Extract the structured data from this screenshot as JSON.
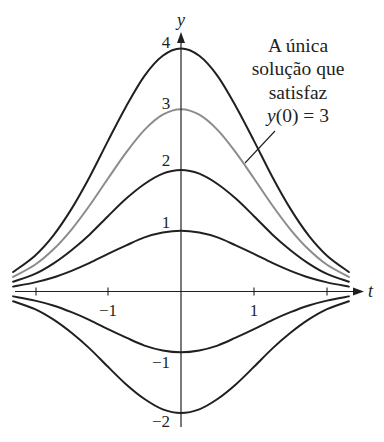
{
  "chart_data": {
    "type": "line",
    "title": "",
    "xlabel": "t",
    "ylabel": "y",
    "xlim": [
      -2.3,
      2.35
    ],
    "ylim": [
      -2.2,
      4.3
    ],
    "grid": false,
    "legend": null,
    "x_ticks": [
      -2,
      -1,
      1,
      2
    ],
    "x_tick_labels": [
      "",
      "−1",
      "1",
      ""
    ],
    "y_tick_labels": [
      "4",
      "3",
      "2",
      "1",
      "−1",
      "−2"
    ],
    "x": [
      -2.3,
      -2,
      -1.75,
      -1.5,
      -1.25,
      -1,
      -0.75,
      -0.5,
      -0.25,
      0,
      0.25,
      0.5,
      0.75,
      1,
      1.25,
      1.5,
      1.75,
      2,
      2.3
    ],
    "series": [
      {
        "name": "y(0) = 4",
        "color": "#231f20",
        "values": [
          0.32,
          0.59,
          0.92,
          1.36,
          1.89,
          2.48,
          3.05,
          3.55,
          3.88,
          4,
          3.88,
          3.55,
          3.05,
          2.48,
          1.89,
          1.36,
          0.92,
          0.59,
          0.32
        ]
      },
      {
        "name": "y(0) = 3",
        "color": "#8c8c8c",
        "highlight": true,
        "values": [
          0.24,
          0.44,
          0.69,
          1.02,
          1.42,
          1.86,
          2.29,
          2.66,
          2.91,
          3,
          2.91,
          2.66,
          2.29,
          1.86,
          1.42,
          1.02,
          0.69,
          0.44,
          0.24
        ]
      },
      {
        "name": "y(0) = 2",
        "color": "#231f20",
        "values": [
          0.16,
          0.29,
          0.46,
          0.68,
          0.94,
          1.24,
          1.53,
          1.77,
          1.94,
          2,
          1.94,
          1.77,
          1.53,
          1.24,
          0.94,
          0.68,
          0.46,
          0.29,
          0.16
        ]
      },
      {
        "name": "y(0) = 1",
        "color": "#231f20",
        "values": [
          0.08,
          0.15,
          0.23,
          0.34,
          0.47,
          0.62,
          0.76,
          0.89,
          0.97,
          1,
          0.97,
          0.89,
          0.76,
          0.62,
          0.47,
          0.34,
          0.23,
          0.15,
          0.08
        ]
      },
      {
        "name": "y(0) = −1",
        "color": "#231f20",
        "values": [
          -0.08,
          -0.15,
          -0.23,
          -0.34,
          -0.47,
          -0.62,
          -0.76,
          -0.89,
          -0.97,
          -1,
          -0.97,
          -0.89,
          -0.76,
          -0.62,
          -0.47,
          -0.34,
          -0.23,
          -0.15,
          -0.08
        ]
      },
      {
        "name": "y(0) = −2",
        "color": "#231f20",
        "values": [
          -0.16,
          -0.29,
          -0.46,
          -0.68,
          -0.94,
          -1.24,
          -1.53,
          -1.77,
          -1.94,
          -2,
          -1.94,
          -1.77,
          -1.53,
          -1.24,
          -0.94,
          -0.68,
          -0.46,
          -0.29,
          -0.16
        ]
      }
    ],
    "annotations": [
      {
        "text": "A única solução que satisfaz y(0) = 3",
        "points_to_series": "y(0) = 3"
      }
    ]
  },
  "axes": {
    "x_label": "t",
    "y_label": "y",
    "x_ticks": {
      "neg1": "−1",
      "pos1": "1"
    },
    "y_ticks": {
      "p4": "4",
      "p3": "3",
      "p2": "2",
      "p1": "1",
      "n1": "−1",
      "n2": "−2"
    }
  },
  "annotation": {
    "line1": "A única",
    "line2": "solução que",
    "line3": "satisfaz",
    "line4_var": "y",
    "line4_rest": "(0) = 3"
  }
}
